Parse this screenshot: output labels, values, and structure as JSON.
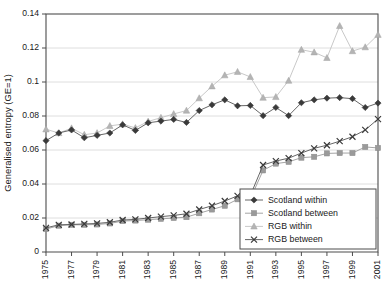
{
  "chart_data": {
    "type": "line",
    "title": "",
    "xlabel": "",
    "ylabel": "Generalised entropy (GE=1)",
    "xlim": [
      1975,
      2001
    ],
    "ylim": [
      0,
      0.14
    ],
    "ytick_step": 0.02,
    "ytick_labels": [
      "0",
      "0.02",
      "0.04",
      "0.06",
      "0.08",
      "0.1",
      "0.12",
      "0.14"
    ],
    "ytick_values": [
      0,
      0.02,
      0.04,
      0.06,
      0.08,
      0.1,
      0.12,
      0.14
    ],
    "xtick_labels": [
      "1975",
      "1977",
      "1979",
      "1981",
      "1983",
      "1985",
      "1987",
      "1989",
      "1991",
      "1993",
      "1995",
      "1997",
      "1999",
      "2001"
    ],
    "xtick_values": [
      1975,
      1977,
      1979,
      1981,
      1983,
      1985,
      1987,
      1989,
      1991,
      1993,
      1995,
      1997,
      1999,
      2001
    ],
    "grid": "horizontal",
    "legend_position": "bottom-right",
    "x": [
      1975,
      1976,
      1977,
      1978,
      1979,
      1980,
      1981,
      1982,
      1983,
      1984,
      1985,
      1986,
      1987,
      1988,
      1989,
      1990,
      1991,
      1992,
      1993,
      1994,
      1995,
      1996,
      1997,
      1998,
      1999,
      2000,
      2001
    ],
    "series": [
      {
        "name": "Scotland within",
        "marker": "diamond",
        "color": "#3a3a3a",
        "values": [
          0.0655,
          0.07,
          0.0718,
          0.0672,
          0.0686,
          0.07,
          0.0748,
          0.0715,
          0.076,
          0.077,
          0.078,
          0.0762,
          0.0832,
          0.0866,
          0.0895,
          0.086,
          0.0862,
          0.0802,
          0.085,
          0.0802,
          0.0878,
          0.0895,
          0.0905,
          0.0908,
          0.0902,
          0.085,
          0.0876
        ]
      },
      {
        "name": "Scotland between",
        "marker": "square",
        "color": "#9a9a9a",
        "values": [
          0.0135,
          0.0155,
          0.016,
          0.016,
          0.0162,
          0.0168,
          0.0182,
          0.0185,
          0.019,
          0.0195,
          0.02,
          0.0205,
          0.0228,
          0.025,
          0.0272,
          0.031,
          0.0312,
          0.048,
          0.052,
          0.053,
          0.0555,
          0.056,
          0.058,
          0.0582,
          0.0582,
          0.0618,
          0.0612
        ]
      },
      {
        "name": "RGB within",
        "marker": "triangle",
        "color": "#b4b4b4",
        "values": [
          0.0722,
          0.07,
          0.0728,
          0.069,
          0.07,
          0.0742,
          0.0752,
          0.073,
          0.0768,
          0.079,
          0.0812,
          0.0832,
          0.0905,
          0.0975,
          0.104,
          0.106,
          0.103,
          0.0908,
          0.0912,
          0.1008,
          0.119,
          0.1175,
          0.1142,
          0.133,
          0.1182,
          0.1205,
          0.1278
        ]
      },
      {
        "name": "RGB between",
        "marker": "cross",
        "color": "#3a3a3a",
        "values": [
          0.0142,
          0.016,
          0.0162,
          0.0165,
          0.0168,
          0.0175,
          0.0188,
          0.0192,
          0.02,
          0.0208,
          0.0215,
          0.0225,
          0.025,
          0.0272,
          0.03,
          0.033,
          0.0332,
          0.0512,
          0.0535,
          0.0552,
          0.0582,
          0.061,
          0.0628,
          0.0652,
          0.0678,
          0.0718,
          0.0782
        ]
      }
    ]
  }
}
